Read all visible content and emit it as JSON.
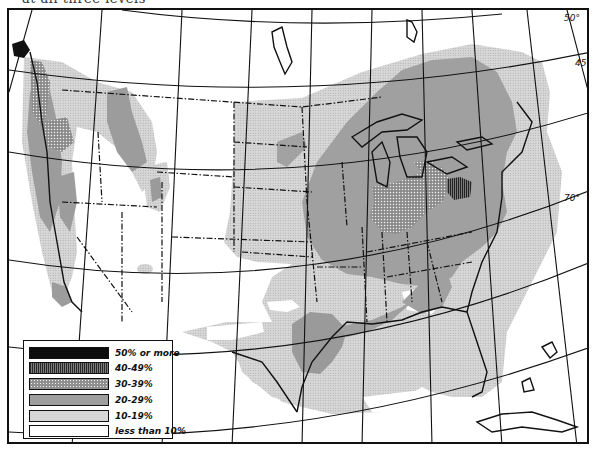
{
  "header": {
    "caption_fragment": "at all three levels"
  },
  "map": {
    "type": "choropleth",
    "region": "United States",
    "graticule_labels": [
      {
        "id": "lat-50",
        "text": "50°"
      },
      {
        "id": "lat-45",
        "text": "45°"
      },
      {
        "id": "lon-70",
        "text": "70°"
      }
    ],
    "colors": {
      "band_50_plus": "#0d0d0d",
      "band_40_49": "#4a4a4a",
      "band_30_39": "#8f8f8f",
      "band_20_29": "#9e9e9e",
      "band_10_19": "#d6d6d6",
      "band_under_10": "#ffffff",
      "lines": "#111111"
    }
  },
  "legend": {
    "items": [
      {
        "key": "50-plus",
        "label": "50% or more"
      },
      {
        "key": "40-49",
        "label": "40-49%"
      },
      {
        "key": "30-39",
        "label": "30-39%"
      },
      {
        "key": "20-29",
        "label": "20-29%"
      },
      {
        "key": "10-19",
        "label": "10-19%"
      },
      {
        "key": "under-10",
        "label": "less than 10%"
      }
    ]
  }
}
